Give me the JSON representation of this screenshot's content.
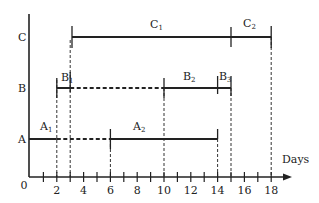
{
  "diagram": {
    "type": "gantt-timeline",
    "x_axis": {
      "label": "Days",
      "origin_label": "0",
      "tick_labels": [
        "2",
        "4",
        "6",
        "8",
        "10",
        "12",
        "14",
        "16",
        "18"
      ],
      "tick_values": [
        2,
        4,
        6,
        8,
        10,
        12,
        14,
        16,
        18
      ],
      "minor_ticks": [
        1,
        2,
        3,
        4,
        5,
        6,
        7,
        8,
        9,
        10,
        11,
        12,
        13,
        14,
        15,
        16,
        17,
        18
      ],
      "range": [
        0,
        19
      ]
    },
    "rows": [
      {
        "name": "A",
        "segments": [
          {
            "label": "A",
            "sub": "1",
            "start": 0,
            "end": 2,
            "style": "solid"
          },
          {
            "label": "",
            "sub": "",
            "start": 2,
            "end": 6,
            "style": "dashed"
          },
          {
            "label": "A",
            "sub": "2",
            "start": 6,
            "end": 14,
            "style": "solid"
          }
        ]
      },
      {
        "name": "B",
        "segments": [
          {
            "label": "B",
            "sub": "1",
            "start": 2,
            "end": 3,
            "style": "solid"
          },
          {
            "label": "",
            "sub": "",
            "start": 3,
            "end": 10,
            "style": "dashed"
          },
          {
            "label": "B",
            "sub": "2",
            "start": 10,
            "end": 14,
            "style": "solid"
          },
          {
            "label": "B",
            "sub": "3",
            "start": 14,
            "end": 15,
            "style": "solid"
          }
        ]
      },
      {
        "name": "C",
        "segments": [
          {
            "label": "C",
            "sub": "1",
            "start": 3,
            "end": 15,
            "style": "solid"
          },
          {
            "label": "C",
            "sub": "2",
            "start": 15,
            "end": 18,
            "style": "solid"
          }
        ]
      }
    ],
    "guide_lines_at": [
      2,
      3,
      6,
      10,
      14,
      15,
      18
    ]
  },
  "labels": {
    "row_a": "A",
    "row_b": "B",
    "row_c": "C",
    "origin": "0",
    "days": "Days",
    "a1": "A",
    "a1_sub": "1",
    "a2": "A",
    "a2_sub": "2",
    "b1": "B",
    "b1_sub": "1",
    "b2": "B",
    "b2_sub": "2",
    "b3": "B",
    "b3_sub": "3",
    "c1": "C",
    "c1_sub": "1",
    "c2": "C",
    "c2_sub": "2",
    "ticks": [
      "2",
      "4",
      "6",
      "8",
      "10",
      "12",
      "14",
      "16",
      "18"
    ]
  },
  "colors": {
    "ink": "#222222",
    "background": "#ffffff"
  }
}
